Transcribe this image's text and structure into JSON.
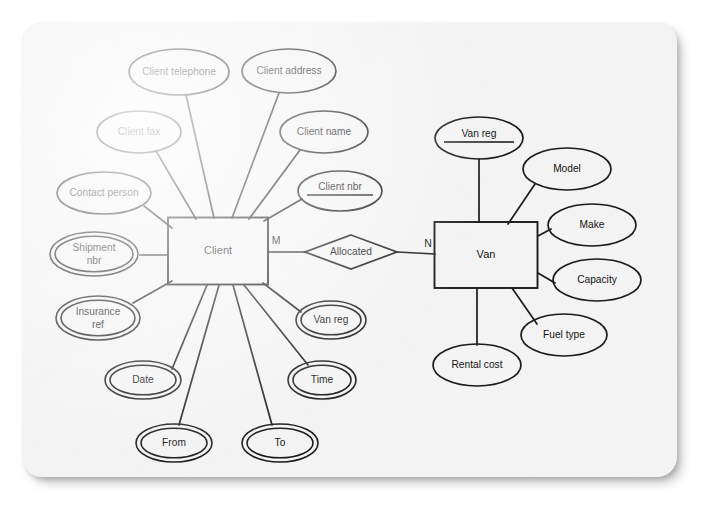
{
  "diagram": {
    "type": "entity-relationship-diagram",
    "notation": "Chen",
    "page_background": "#f4f4f4",
    "line_color": "#1b1b1b",
    "shape_fill": "#fdfdfd",
    "entities": [
      {
        "id": "client",
        "label": "Client",
        "x": 218,
        "y": 251,
        "w": 100,
        "h": 67
      },
      {
        "id": "van",
        "label": "Van",
        "x": 486,
        "y": 255,
        "w": 103,
        "h": 66
      }
    ],
    "relationships": [
      {
        "id": "allocated",
        "label": "Allocated",
        "x": 351,
        "y": 252,
        "w": 92,
        "h": 34
      }
    ],
    "cardinalities": [
      {
        "id": "m-client-side",
        "label": "M",
        "x": 276,
        "y": 241
      },
      {
        "id": "n-van-side",
        "label": "N",
        "x": 428,
        "y": 244
      }
    ],
    "attributes": [
      {
        "id": "client-telephone",
        "label": "Client telephone",
        "x": 179,
        "y": 72,
        "rx": 50,
        "ry": 23,
        "double": false,
        "key": false,
        "owner": "client"
      },
      {
        "id": "client-address",
        "label": "Client address",
        "x": 289,
        "y": 71,
        "rx": 47,
        "ry": 22,
        "double": false,
        "key": false,
        "owner": "client"
      },
      {
        "id": "client-fax",
        "label": "Client fax",
        "x": 139,
        "y": 132,
        "rx": 42,
        "ry": 21,
        "double": false,
        "key": false,
        "owner": "client"
      },
      {
        "id": "client-name",
        "label": "Client name",
        "x": 324,
        "y": 132,
        "rx": 44,
        "ry": 21,
        "double": false,
        "key": false,
        "owner": "client"
      },
      {
        "id": "contact-person",
        "label": "Contact person",
        "x": 104,
        "y": 193,
        "rx": 47,
        "ry": 21,
        "double": false,
        "key": false,
        "owner": "client"
      },
      {
        "id": "client-nbr",
        "label": "Client nbr",
        "x": 340,
        "y": 191,
        "rx": 42,
        "ry": 20,
        "double": false,
        "key": true,
        "owner": "client"
      },
      {
        "id": "shipment-nbr",
        "label": "Shipment\nnbr",
        "x": 94,
        "y": 254,
        "rx": 44,
        "ry": 22,
        "double": true,
        "key": false,
        "owner": "client"
      },
      {
        "id": "insurance-ref",
        "label": "Insurance\nref",
        "x": 98,
        "y": 318,
        "rx": 42,
        "ry": 22,
        "double": true,
        "key": false,
        "owner": "client"
      },
      {
        "id": "van-reg-client",
        "label": "Van reg",
        "x": 331,
        "y": 320,
        "rx": 35,
        "ry": 19,
        "double": true,
        "key": false,
        "owner": "client"
      },
      {
        "id": "date",
        "label": "Date",
        "x": 143,
        "y": 380,
        "rx": 38,
        "ry": 19,
        "double": true,
        "key": false,
        "owner": "client"
      },
      {
        "id": "time",
        "label": "Time",
        "x": 322,
        "y": 380,
        "rx": 34,
        "ry": 19,
        "double": true,
        "key": false,
        "owner": "client"
      },
      {
        "id": "from",
        "label": "From",
        "x": 174,
        "y": 443,
        "rx": 38,
        "ry": 19,
        "double": true,
        "key": false,
        "owner": "client"
      },
      {
        "id": "to",
        "label": "To",
        "x": 280,
        "y": 443,
        "rx": 38,
        "ry": 19,
        "double": true,
        "key": false,
        "owner": "client"
      },
      {
        "id": "van-reg-key",
        "label": "Van reg",
        "x": 479,
        "y": 138,
        "rx": 44,
        "ry": 21,
        "double": false,
        "key": true,
        "owner": "van"
      },
      {
        "id": "model",
        "label": "Model",
        "x": 567,
        "y": 169,
        "rx": 44,
        "ry": 21,
        "double": false,
        "key": false,
        "owner": "van"
      },
      {
        "id": "make",
        "label": "Make",
        "x": 592,
        "y": 225,
        "rx": 44,
        "ry": 21,
        "double": false,
        "key": false,
        "owner": "van"
      },
      {
        "id": "capacity",
        "label": "Capacity",
        "x": 597,
        "y": 280,
        "rx": 44,
        "ry": 21,
        "double": false,
        "key": false,
        "owner": "van"
      },
      {
        "id": "fuel-type",
        "label": "Fuel type",
        "x": 564,
        "y": 335,
        "rx": 43,
        "ry": 21,
        "double": false,
        "key": false,
        "owner": "van"
      },
      {
        "id": "rental-cost",
        "label": "Rental cost",
        "x": 477,
        "y": 365,
        "rx": 44,
        "ry": 21,
        "double": false,
        "key": false,
        "owner": "van"
      }
    ],
    "connectors": [
      {
        "id": "c-client-telephone",
        "from": "client",
        "to": "client-telephone",
        "x1": 214,
        "y1": 218,
        "x2": 186,
        "y2": 95
      },
      {
        "id": "c-client-address",
        "from": "client",
        "to": "client-address",
        "x1": 232,
        "y1": 218,
        "x2": 279,
        "y2": 93
      },
      {
        "id": "c-client-fax",
        "from": "client",
        "to": "client-fax",
        "x1": 196,
        "y1": 219,
        "x2": 156,
        "y2": 151
      },
      {
        "id": "c-client-name",
        "from": "client",
        "to": "client-name",
        "x1": 249,
        "y1": 219,
        "x2": 300,
        "y2": 150
      },
      {
        "id": "c-contact-person",
        "from": "client",
        "to": "contact-person",
        "x1": 172,
        "y1": 228,
        "x2": 144,
        "y2": 206
      },
      {
        "id": "c-client-nbr",
        "from": "client",
        "to": "client-nbr",
        "x1": 264,
        "y1": 221,
        "x2": 302,
        "y2": 199
      },
      {
        "id": "c-shipment-nbr",
        "from": "client",
        "to": "shipment-nbr",
        "x1": 168,
        "y1": 255,
        "x2": 140,
        "y2": 255
      },
      {
        "id": "c-insurance-ref",
        "from": "client",
        "to": "insurance-ref",
        "x1": 172,
        "y1": 281,
        "x2": 133,
        "y2": 303
      },
      {
        "id": "c-van-reg-client",
        "from": "client",
        "to": "van-reg-client",
        "x1": 263,
        "y1": 283,
        "x2": 301,
        "y2": 312
      },
      {
        "id": "c-date",
        "from": "client",
        "to": "date",
        "x1": 207,
        "y1": 285,
        "x2": 172,
        "y2": 369
      },
      {
        "id": "c-time",
        "from": "client",
        "to": "time",
        "x1": 244,
        "y1": 285,
        "x2": 308,
        "y2": 365
      },
      {
        "id": "c-from",
        "from": "client",
        "to": "from",
        "x1": 219,
        "y1": 285,
        "x2": 179,
        "y2": 425
      },
      {
        "id": "c-to",
        "from": "client",
        "to": "to",
        "x1": 233,
        "y1": 285,
        "x2": 272,
        "y2": 425
      },
      {
        "id": "c-client-allocated",
        "from": "client",
        "to": "allocated",
        "x1": 268,
        "y1": 252,
        "x2": 305,
        "y2": 252
      },
      {
        "id": "c-allocated-van",
        "from": "allocated",
        "to": "van",
        "x1": 397,
        "y1": 252,
        "x2": 435,
        "y2": 254
      },
      {
        "id": "c-van-reg-key",
        "from": "van",
        "to": "van-reg-key",
        "x1": 479,
        "y1": 222,
        "x2": 479,
        "y2": 159
      },
      {
        "id": "c-model",
        "from": "van",
        "to": "model",
        "x1": 508,
        "y1": 224,
        "x2": 535,
        "y2": 184
      },
      {
        "id": "c-make",
        "from": "van",
        "to": "make",
        "x1": 538,
        "y1": 236,
        "x2": 551,
        "y2": 229
      },
      {
        "id": "c-capacity",
        "from": "van",
        "to": "capacity",
        "x1": 538,
        "y1": 273,
        "x2": 555,
        "y2": 283
      },
      {
        "id": "c-fuel-type",
        "from": "van",
        "to": "fuel-type",
        "x1": 512,
        "y1": 288,
        "x2": 537,
        "y2": 324
      },
      {
        "id": "c-rental-cost",
        "from": "van",
        "to": "rental-cost",
        "x1": 477,
        "y1": 288,
        "x2": 477,
        "y2": 345
      }
    ]
  }
}
